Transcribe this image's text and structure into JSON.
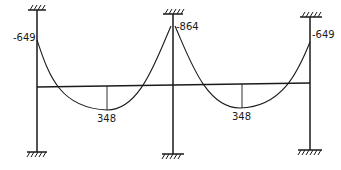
{
  "diagram": {
    "type": "bending-moment-diagram",
    "structure": "two-bay portal frame with fixed supports",
    "colors": {
      "ink": "#1a1a1a",
      "background": "#ffffff"
    },
    "columns": [
      {
        "id": "left",
        "x": 37,
        "top_support": "fixed",
        "bottom_support": "fixed"
      },
      {
        "id": "middle",
        "x": 173,
        "top_support": "fixed",
        "bottom_support": "fixed"
      },
      {
        "id": "right",
        "x": 310,
        "top_support": "fixed",
        "bottom_support": "fixed"
      }
    ],
    "labels": {
      "left_support_moment": "-649",
      "middle_support_moment": "-864",
      "right_support_moment": "-649",
      "left_span_midspan_moment": "348",
      "right_span_midspan_moment": "348"
    },
    "caption_partial": "... 348 ..."
  }
}
